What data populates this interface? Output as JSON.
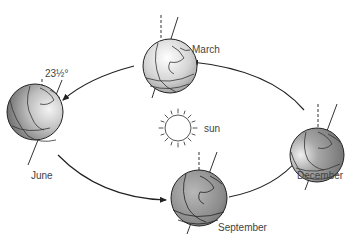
{
  "diagram": {
    "type": "earth-orbit-seasons",
    "center_label": "sun",
    "tilt_label": "23½°",
    "positions": [
      {
        "month": "March",
        "label": "March"
      },
      {
        "month": "June",
        "label": "June"
      },
      {
        "month": "September",
        "label": "September"
      },
      {
        "month": "December",
        "label": "December"
      }
    ],
    "orbit_direction": [
      "December",
      "March",
      "June",
      "September",
      "December"
    ],
    "colors": {
      "background": "#ffffff",
      "line": "#222222",
      "label": "#444444",
      "globe_dark": "#6e6e6e",
      "globe_light": "#f2f2f2"
    }
  }
}
